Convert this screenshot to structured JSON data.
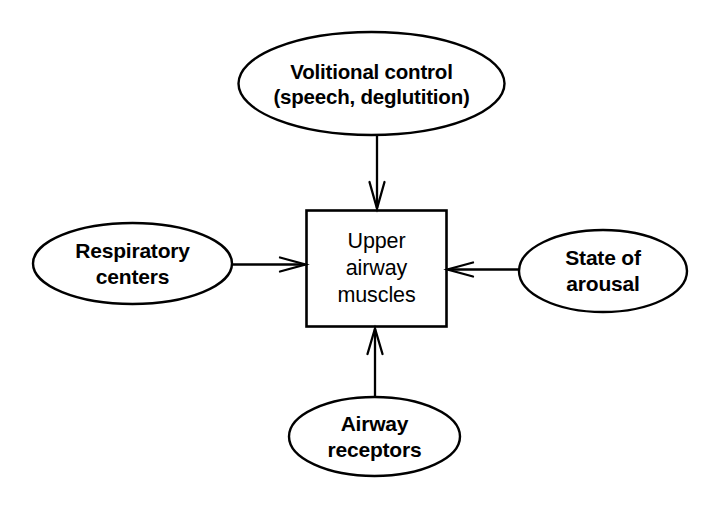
{
  "diagram": {
    "background_color": "#ffffff",
    "stroke_color": "#000000",
    "text_color": "#000000",
    "nodes": [
      {
        "id": "volitional-control",
        "shape": "ellipse",
        "lines": [
          "Volitional control",
          "(speech, deglutition)"
        ],
        "line1": "Volitional control",
        "line2": "(speech, deglutition)",
        "position": "top"
      },
      {
        "id": "respiratory-centers",
        "shape": "ellipse",
        "lines": [
          "Respiratory",
          "centers"
        ],
        "line1": "Respiratory",
        "line2": "centers",
        "position": "left"
      },
      {
        "id": "upper-airway-muscles",
        "shape": "rectangle",
        "lines": [
          "Upper",
          "airway",
          "muscles"
        ],
        "line1": "Upper",
        "line2": "airway",
        "line3": "muscles",
        "position": "center"
      },
      {
        "id": "state-of-arousal",
        "shape": "ellipse",
        "lines": [
          "State of",
          "arousal"
        ],
        "line1": "State of",
        "line2": "arousal",
        "position": "right"
      },
      {
        "id": "airway-receptors",
        "shape": "ellipse",
        "lines": [
          "Airway",
          "receptors"
        ],
        "line1": "Airway",
        "line2": "receptors",
        "position": "bottom"
      }
    ],
    "edges": [
      {
        "id": "edge-volitional-to-box",
        "from": "volitional-control",
        "to": "upper-airway-muscles",
        "direction": "down",
        "arrowhead": "open-v"
      },
      {
        "id": "edge-respiratory-to-box",
        "from": "respiratory-centers",
        "to": "upper-airway-muscles",
        "direction": "right",
        "arrowhead": "open-v"
      },
      {
        "id": "edge-arousal-to-box",
        "from": "state-of-arousal",
        "to": "upper-airway-muscles",
        "direction": "left",
        "arrowhead": "open-v"
      },
      {
        "id": "edge-receptors-to-box",
        "from": "airway-receptors",
        "to": "upper-airway-muscles",
        "direction": "up",
        "arrowhead": "open-v"
      }
    ]
  }
}
